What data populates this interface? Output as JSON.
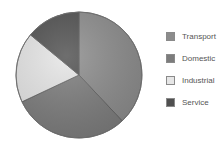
{
  "chart_data": {
    "type": "pie",
    "title": "",
    "categories": [
      "Transport",
      "Domestic",
      "Industrial",
      "Service"
    ],
    "values": [
      38,
      30,
      18,
      14
    ],
    "start_angle_deg": 0,
    "direction": "clockwise",
    "colors": [
      "#8c8c8c",
      "#7c7c7c",
      "#e6e6e6",
      "#4f4f4f"
    ],
    "legend_position": "right"
  },
  "legend": {
    "items": [
      {
        "label": "Transport",
        "color": "#8c8c8c"
      },
      {
        "label": "Domestic",
        "color": "#7c7c7c"
      },
      {
        "label": "Industrial",
        "color": "#e6e6e6"
      },
      {
        "label": "Service",
        "color": "#4f4f4f"
      }
    ]
  }
}
